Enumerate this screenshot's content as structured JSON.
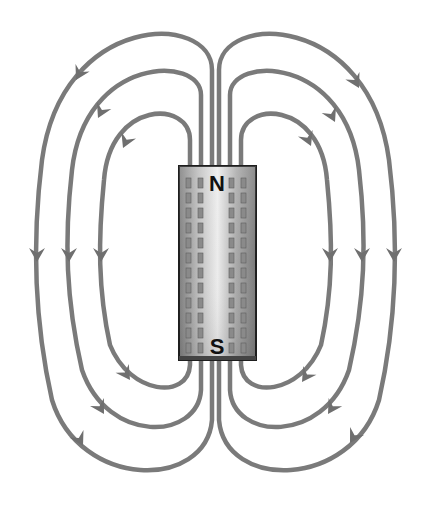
{
  "diagram": {
    "magnet": {
      "north_label": "N",
      "south_label": "S",
      "colors": {
        "body_light": "#e4e4e4",
        "body_dark": "#8c8c8c",
        "border": "#222222"
      }
    },
    "field_lines": {
      "color": "#7a7a7a",
      "count_per_side": 3,
      "direction_left": "N to S, arrows pointing down (counter-clockwise loops)",
      "direction_right": "N to S, arrows pointing down (clockwise loops)",
      "loops": [
        {
          "side": "left",
          "index": "inner"
        },
        {
          "side": "left",
          "index": "middle"
        },
        {
          "side": "left",
          "index": "outer"
        },
        {
          "side": "right",
          "index": "inner"
        },
        {
          "side": "right",
          "index": "middle"
        },
        {
          "side": "right",
          "index": "outer"
        }
      ]
    }
  }
}
